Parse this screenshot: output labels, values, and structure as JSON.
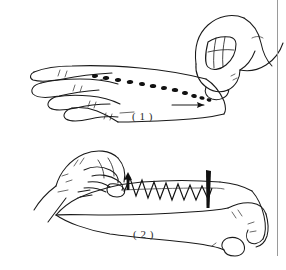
{
  "figure": {
    "background_color": "#ffffff",
    "ink_color": "#1a1a1a",
    "rule_color": "#9a9a9a",
    "width": 286,
    "height": 270
  },
  "panels": [
    {
      "id": "panel-1",
      "caption": "( 1 )",
      "subject": "back of left hand, fingers spread, viewed from the side",
      "acting_hand": "right hand, fist with index finger extended, fingertip pressing the back of the hand",
      "marking": {
        "name": "dotted-treatment-line",
        "description": "row of short dark dashes / dots running along the back of the hand from the knuckles toward the wrist",
        "dot_count": 12
      },
      "direction_arrow": {
        "name": "direction-arrow-1",
        "label": "",
        "points": "right"
      }
    },
    {
      "id": "panel-2",
      "caption": "( 2 )",
      "subject": "forearm and hand resting palm-down, seen from the side",
      "acting_hand": "right hand pinching / grasping at the wrist end",
      "marking": {
        "name": "zigzag-treatment-line",
        "description": "sawtooth zig-zag line drawn along the top of the forearm",
        "peak_count": 11
      },
      "direction_arrow": {
        "name": "direction-arrow-2",
        "label": "",
        "points": "up"
      },
      "end_marker": {
        "name": "stop-bar-marker",
        "description": "thick solid black vertical bar marking the end point of the stroke"
      }
    }
  ],
  "colors": {
    "ink": "#1a1a1a",
    "paper": "#ffffff",
    "rule": "#9a9a9a"
  }
}
